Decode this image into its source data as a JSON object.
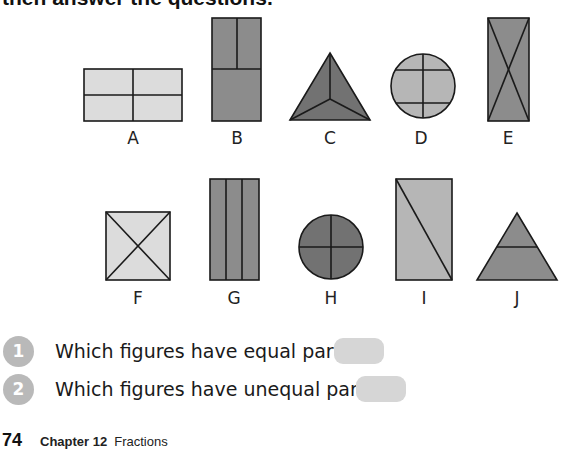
{
  "header": {
    "instruction_text": "then answer the questions."
  },
  "colors": {
    "light_fill": "#dcdcdc",
    "medium_fill": "#b6b6b6",
    "dark_fill": "#8c8c8c",
    "darker_fill": "#727272",
    "stroke": "#1a1a1a",
    "badge": "#b9b9b9",
    "answer_box": "#d6d6d6"
  },
  "figures": [
    {
      "label": "A",
      "shape": "rectangle",
      "division": "2x2 grid",
      "parts": 4,
      "equal": true
    },
    {
      "label": "B",
      "shape": "rectangle",
      "division": "top half split in two, bottom half whole",
      "parts": 3,
      "equal": false
    },
    {
      "label": "C",
      "shape": "triangle",
      "division": "three lines from center to vertices",
      "parts": 3,
      "equal": true
    },
    {
      "label": "D",
      "shape": "circle",
      "division": "vertical line plus two horizontal chords",
      "parts": 6,
      "equal": false
    },
    {
      "label": "E",
      "shape": "rectangle",
      "division": "two diagonals",
      "parts": 4,
      "equal": false
    },
    {
      "label": "F",
      "shape": "square",
      "division": "two diagonals",
      "parts": 4,
      "equal": true
    },
    {
      "label": "G",
      "shape": "rectangle",
      "division": "three vertical strips",
      "parts": 3,
      "equal": true
    },
    {
      "label": "H",
      "shape": "circle",
      "division": "quarters",
      "parts": 4,
      "equal": true
    },
    {
      "label": "I",
      "shape": "rectangle",
      "division": "one diagonal",
      "parts": 2,
      "equal": true
    },
    {
      "label": "J",
      "shape": "triangle",
      "division": "one horizontal line",
      "parts": 2,
      "equal": false
    }
  ],
  "questions": [
    {
      "number": "1",
      "text": "Which figures have equal parts?",
      "answer": ""
    },
    {
      "number": "2",
      "text": "Which figures have unequal parts?",
      "answer": ""
    }
  ],
  "footer": {
    "page_number": "74",
    "chapter": "Chapter 12",
    "title": "Fractions"
  }
}
